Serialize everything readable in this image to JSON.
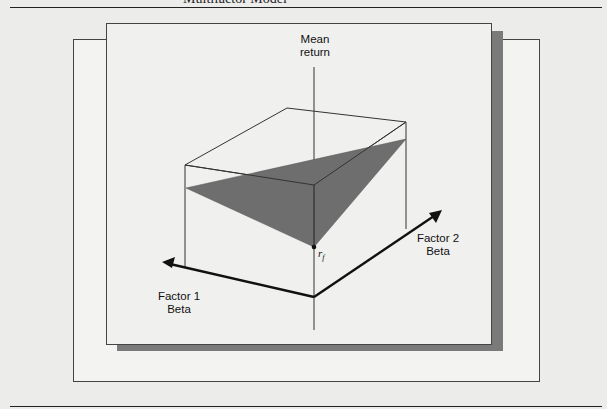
{
  "figure": {
    "title": "Multifactor Model",
    "axes": {
      "vertical": {
        "line1": "Mean",
        "line2": "return"
      },
      "factor1": {
        "line1": "Factor 1",
        "line2": "Beta"
      },
      "factor2": {
        "line1": "Factor 2",
        "line2": "Beta"
      }
    },
    "intercept_label": "r",
    "intercept_subscript": "f",
    "colors": {
      "plane": "#6e6e6e",
      "shadow": "#7a7a7a",
      "lines": "#333333",
      "arrows": "#111111"
    }
  }
}
